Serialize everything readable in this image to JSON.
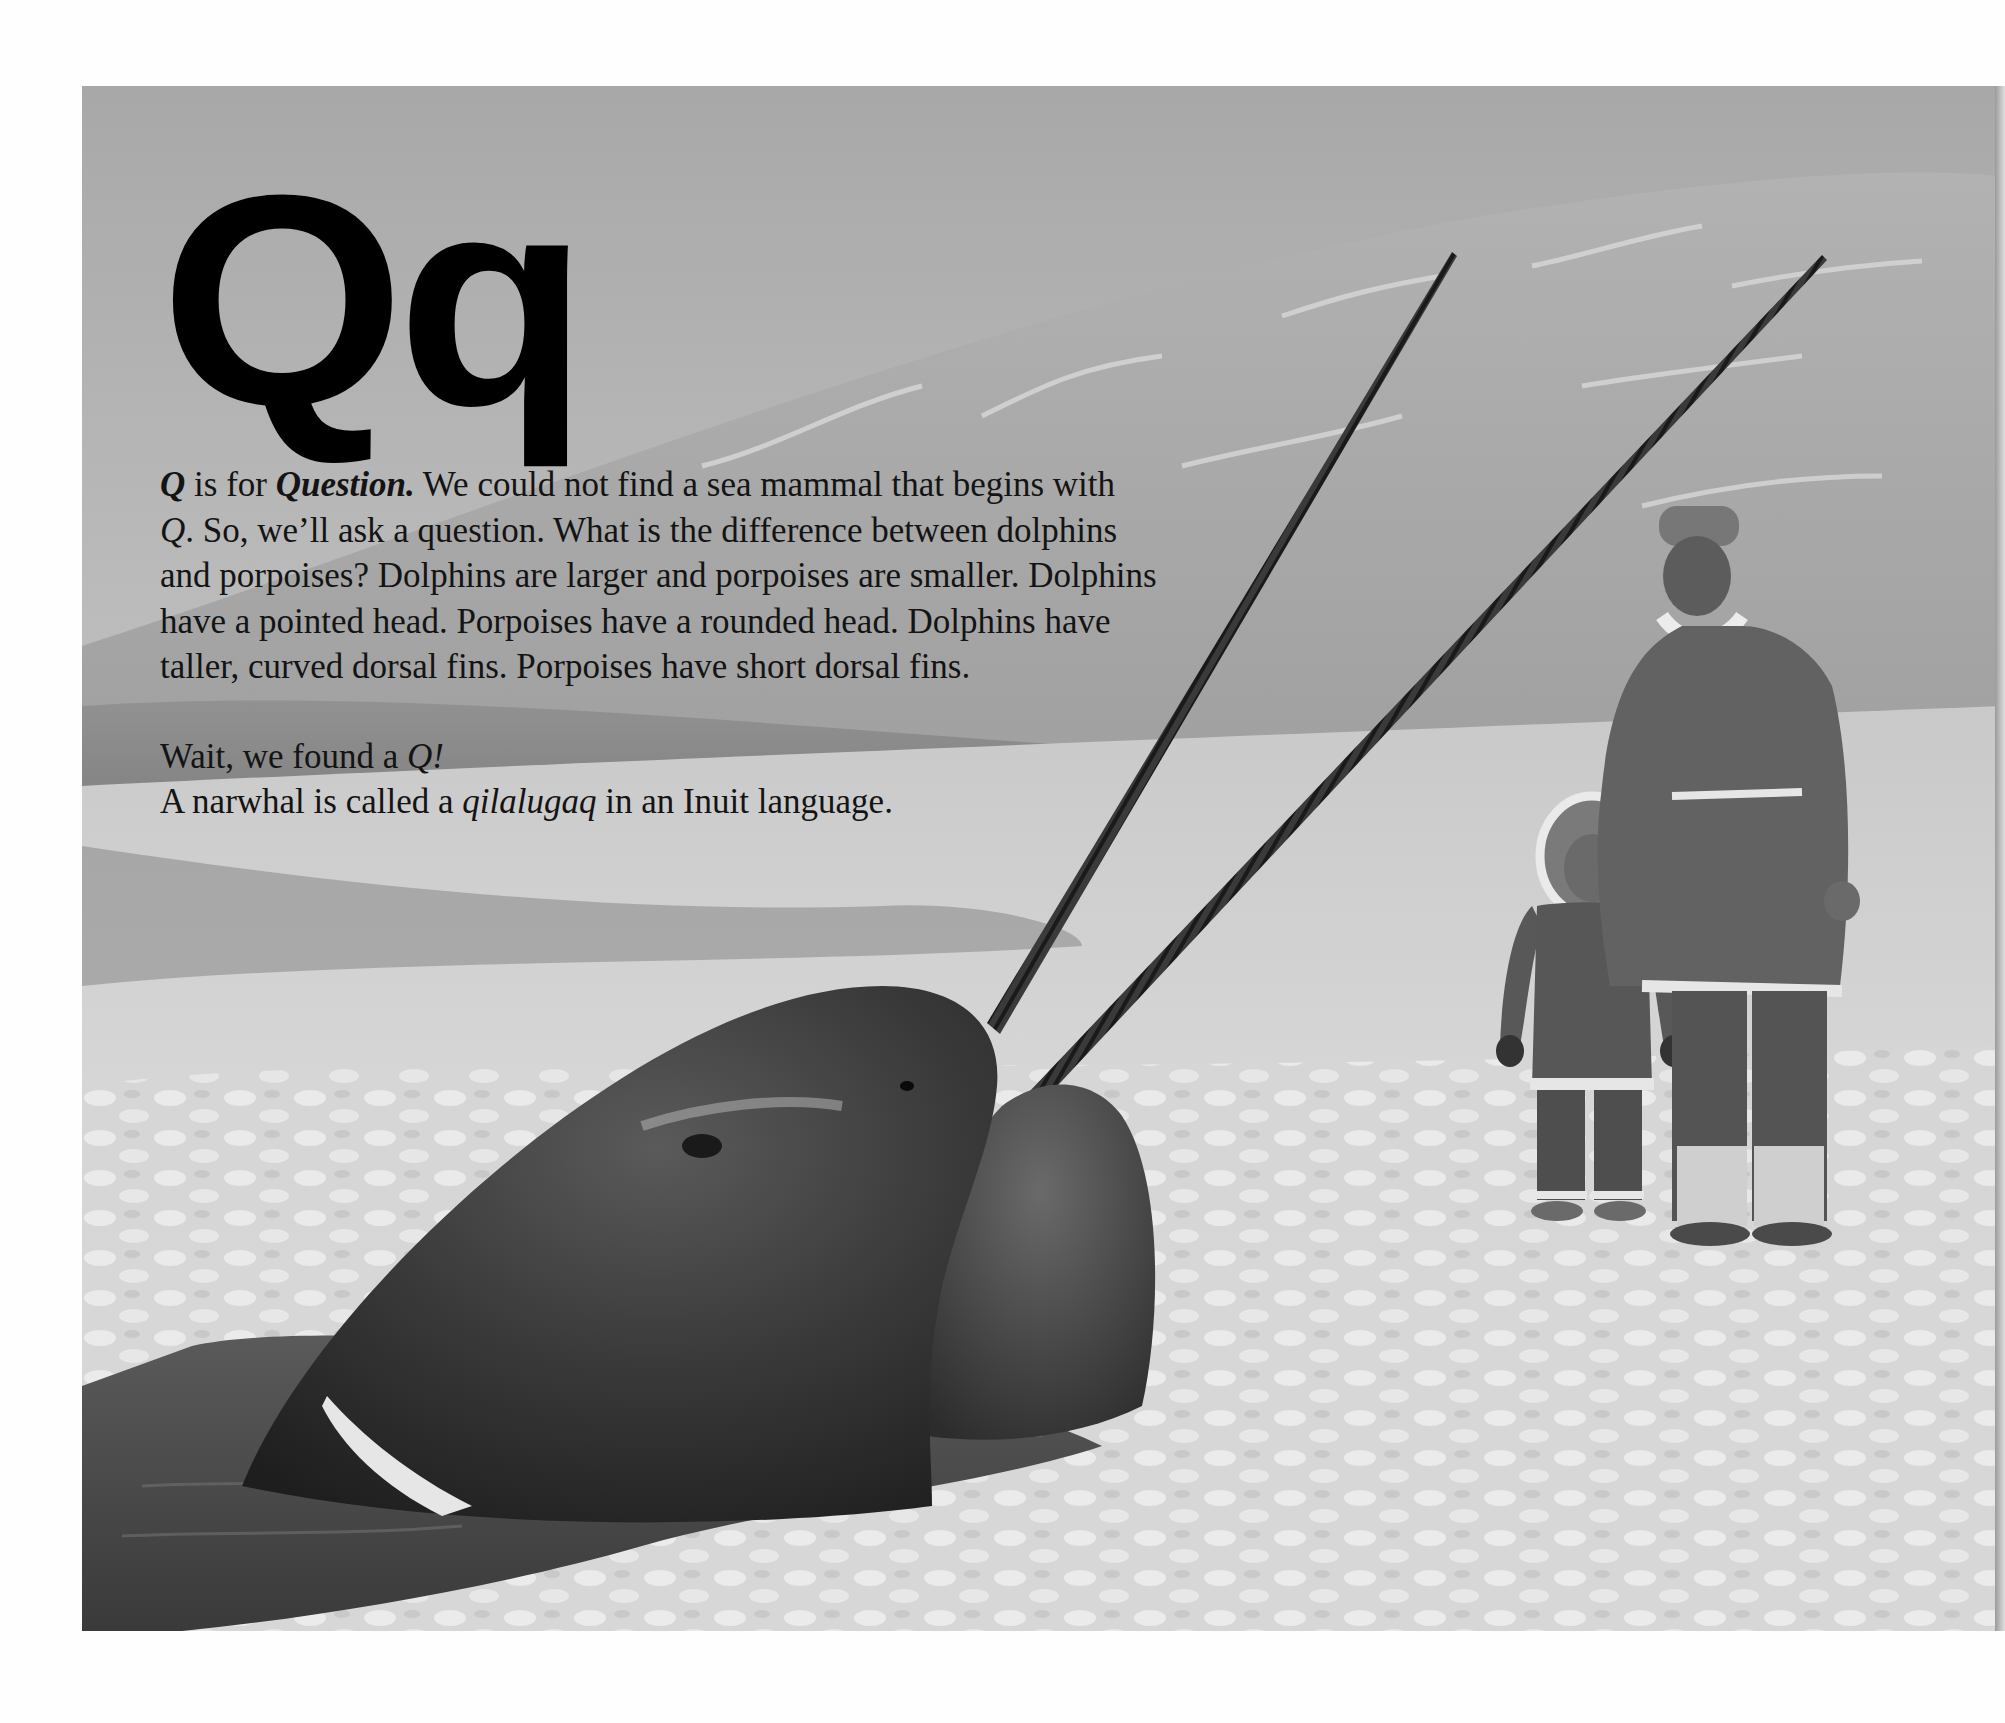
{
  "page": {
    "heading_letter": "Qq",
    "paragraph_1": {
      "q_letter": "Q",
      "is_for": " is for ",
      "keyword": "Question.",
      "lines": [
        " We could not find a sea mammal that begins with",
        "Q",
        ". So, we’ll ask a question. What is the difference between dolphins",
        "and porpoises? Dolphins are larger and porpoises are smaller. Dolphins",
        "have a pointed head. Porpoises have a rounded head. Dolphins have",
        "taller, curved dorsal fins. Porpoises have short dorsal fins."
      ]
    },
    "paragraph_2": {
      "line_1_prefix": "Wait, we found a ",
      "line_1_italic": "Q!",
      "line_2_prefix": "A narwhal is called a ",
      "line_2_italic": "qilalugaq",
      "line_2_suffix": " in an Inuit language."
    }
  },
  "illustration": {
    "subject": "Two narwhals surfacing through an ice hole with crossed tusks; an Inuit adult and child in fur parkas standing on the ice",
    "colors": {
      "sky": "#bdbdbd",
      "far_ice": "#a9a9a9",
      "snow": "#dcdcdc",
      "water": "#4a4a4a",
      "narwhal": "#2e2e2e",
      "parka": "#5a5a5a",
      "fur_trim": "#eeeeee"
    }
  }
}
